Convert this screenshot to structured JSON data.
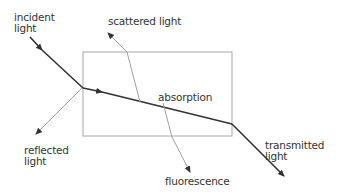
{
  "diagram": {
    "labels": {
      "incident": "incident\nlight",
      "scattered": "scattered light",
      "absorption": "absorption",
      "reflected": "reflected\nlight",
      "fluorescence": "fluorescence",
      "transmitted": "transmitted\nlight"
    },
    "colors": {
      "main_ray": "#333333",
      "secondary_ray": "#a0a0a0",
      "box": "#a8a8a8",
      "text": "#333333"
    }
  }
}
